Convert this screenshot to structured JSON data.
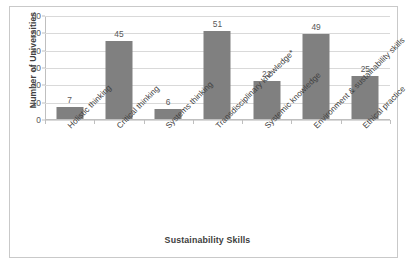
{
  "chart_data": {
    "type": "bar",
    "title": "",
    "xlabel": "Sustainability Skills",
    "ylabel": "Number of Universities",
    "categories": [
      "Holistic thinking",
      "Critical thinking",
      "Systems thinking",
      "Transdisciplinary knowledge*",
      "Systemic knowledge",
      "Environment & sustainability skills",
      "Ethical practice"
    ],
    "values": [
      7,
      45,
      6,
      51,
      22,
      49,
      25
    ],
    "value_labels": [
      "7",
      "45",
      "6",
      "51",
      "22",
      "49",
      "25"
    ],
    "ylim": [
      0,
      60
    ],
    "yticks": [
      0,
      10,
      20,
      30,
      40,
      50,
      60
    ],
    "ytick_labels": [
      "0",
      "10",
      "20",
      "30",
      "40",
      "50",
      "60"
    ],
    "grid": true,
    "legend": false,
    "legend_position": "none",
    "bar_color": "#808080",
    "gridline_color": "#d9d9d9",
    "axis_color": "#bfbfbf",
    "text_color": "#404040",
    "background_color": "#ffffff",
    "border_color": "#c9c9c9"
  }
}
